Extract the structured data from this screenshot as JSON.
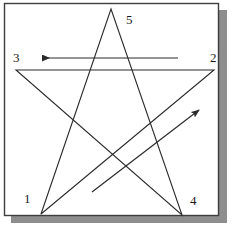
{
  "figure": {
    "canvas": {
      "width": 232,
      "height": 227
    },
    "panel": {
      "background_color": "#ffffff",
      "border_color": "#3d3d3d",
      "shadow_color": "#8e8e8e",
      "x": 4,
      "y": 3,
      "width": 215,
      "height": 213
    },
    "stroke_color": "#2b2b2b",
    "star": {
      "shape": "pentagram",
      "drawn_as": "single continuous polyline",
      "points": [
        {
          "label": "1",
          "x": 41,
          "y": 214
        },
        {
          "label": "2",
          "x": 214,
          "y": 70
        },
        {
          "label": "3",
          "x": 16,
          "y": 70
        },
        {
          "label": "4",
          "x": 182,
          "y": 215
        },
        {
          "label": "5",
          "x": 111,
          "y": 9
        }
      ],
      "path_order": [
        "1",
        "2",
        "3",
        "4",
        "5",
        "1"
      ]
    },
    "vertex_labels": [
      {
        "name": "1",
        "text": "1",
        "x": 24,
        "y": 192
      },
      {
        "name": "2",
        "text": "2",
        "x": 210,
        "y": 51
      },
      {
        "name": "3",
        "text": "3",
        "x": 13,
        "y": 51
      },
      {
        "name": "4",
        "text": "4",
        "x": 190,
        "y": 194
      },
      {
        "name": "5",
        "text": "5",
        "x": 126,
        "y": 13
      }
    ],
    "arrows": [
      {
        "name": "horizontal-direction-arrow",
        "direction": "leftward",
        "from_x": 178,
        "from_y": 58,
        "to_x": 38,
        "to_y": 58,
        "describes_stroke": "2 to 3"
      },
      {
        "name": "diagonal-direction-arrow",
        "direction": "up-right",
        "from_x": 92,
        "from_y": 192,
        "to_x": 203,
        "to_y": 107,
        "describes_stroke": "1 to 2"
      }
    ]
  }
}
